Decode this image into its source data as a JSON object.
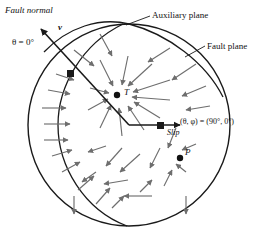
{
  "figure": {
    "type": "focal-mechanism-stereonet",
    "background": "#ffffff",
    "line_color": "#1a1a1a",
    "arrow_color": "#6e6e6e",
    "circle": {
      "cx": 129,
      "cy": 125,
      "r": 101
    },
    "labels": {
      "fault_normal": "Fault normal",
      "theta_zero": "θ = 0°",
      "normal_symbol": "v",
      "auxiliary_plane": "Auxiliary plane",
      "fault_plane": "Fault plane",
      "theta_phi": "(θ, φ) = (90°, 0°)",
      "slip": "Slip",
      "tension_axis": "T",
      "pressure_axis": "P"
    },
    "nodes": {
      "center": {
        "x": 129,
        "y": 125
      },
      "normal_pierce": {
        "x": 71,
        "y": 74
      },
      "slip_pierce": {
        "x": 160,
        "y": 125
      },
      "t_axis": {
        "x": 117,
        "y": 95
      },
      "p_axis": {
        "x": 180,
        "y": 158
      }
    },
    "planes": [
      {
        "name": "auxiliary-plane",
        "path": "M 123 24 C 82 44, 58 86, 58 125 C 58 166, 84 210, 127 226"
      },
      {
        "name": "fault-plane",
        "path": "M 223 97 C 206 63, 168 34, 129 24 C 100 17, 68 27, 44 52"
      }
    ],
    "vectors": {
      "fault_normal_arrow": {
        "x1": 129,
        "y1": 125,
        "x2": 41,
        "y2": 29
      },
      "slip_arrow": {
        "x1": 129,
        "y1": 125,
        "x2": 180,
        "y2": 125
      }
    },
    "leaders": [
      {
        "name": "auxiliary-plane-leader",
        "x1": 150,
        "y1": 16,
        "x2": 126,
        "y2": 25
      },
      {
        "name": "fault-plane-leader",
        "x1": 205,
        "y1": 46,
        "x2": 185,
        "y2": 57
      }
    ],
    "radiation_arrows": [
      {
        "x1": 100,
        "y1": 60,
        "x2": 113,
        "y2": 86,
        "note": "toward-T"
      },
      {
        "x1": 128,
        "y1": 56,
        "x2": 122,
        "y2": 85,
        "note": "toward-T"
      },
      {
        "x1": 152,
        "y1": 64,
        "x2": 128,
        "y2": 86,
        "note": "toward-T"
      },
      {
        "x1": 170,
        "y1": 80,
        "x2": 133,
        "y2": 92,
        "note": "toward-T"
      },
      {
        "x1": 170,
        "y1": 100,
        "x2": 132,
        "y2": 97,
        "note": "toward-T"
      },
      {
        "x1": 160,
        "y1": 118,
        "x2": 134,
        "y2": 102,
        "note": "toward-T"
      },
      {
        "x1": 144,
        "y1": 130,
        "x2": 128,
        "y2": 106,
        "note": "toward-T"
      },
      {
        "x1": 122,
        "y1": 136,
        "x2": 119,
        "y2": 108,
        "note": "toward-T"
      },
      {
        "x1": 100,
        "y1": 128,
        "x2": 111,
        "y2": 105,
        "note": "toward-T"
      },
      {
        "x1": 88,
        "y1": 110,
        "x2": 108,
        "y2": 99,
        "note": "toward-T"
      },
      {
        "x1": 90,
        "y1": 88,
        "x2": 109,
        "y2": 93,
        "note": "toward-T"
      },
      {
        "x1": 170,
        "y1": 48,
        "x2": 148,
        "y2": 62,
        "note": "upper-right-inflow"
      },
      {
        "x1": 196,
        "y1": 64,
        "x2": 172,
        "y2": 80,
        "note": "upper-right-inflow"
      },
      {
        "x1": 206,
        "y1": 86,
        "x2": 182,
        "y2": 96,
        "note": "upper-right-inflow"
      },
      {
        "x1": 210,
        "y1": 106,
        "x2": 186,
        "y2": 110,
        "note": "upper-right-inflow"
      },
      {
        "x1": 100,
        "y1": 34,
        "x2": 112,
        "y2": 56,
        "note": "upper-inflow"
      },
      {
        "x1": 74,
        "y1": 50,
        "x2": 94,
        "y2": 66,
        "note": "upper-inflow"
      },
      {
        "x1": 42,
        "y1": 108,
        "x2": 66,
        "y2": 108,
        "note": "left-outflow"
      },
      {
        "x1": 44,
        "y1": 124,
        "x2": 70,
        "y2": 124,
        "note": "left-outflow"
      },
      {
        "x1": 44,
        "y1": 140,
        "x2": 68,
        "y2": 140,
        "note": "left-outflow"
      },
      {
        "x1": 48,
        "y1": 90,
        "x2": 70,
        "y2": 94,
        "note": "left-outflow"
      },
      {
        "x1": 56,
        "y1": 74,
        "x2": 74,
        "y2": 80,
        "note": "left-outflow"
      },
      {
        "x1": 52,
        "y1": 156,
        "x2": 72,
        "y2": 150,
        "note": "left-outflow"
      },
      {
        "x1": 62,
        "y1": 172,
        "x2": 80,
        "y2": 162,
        "note": "left-outflow"
      },
      {
        "x1": 78,
        "y1": 190,
        "x2": 94,
        "y2": 176,
        "note": "lower-left-outflow"
      },
      {
        "x1": 96,
        "y1": 204,
        "x2": 110,
        "y2": 188,
        "note": "lower-left-outflow"
      },
      {
        "x1": 74,
        "y1": 196,
        "x2": 74,
        "y2": 214,
        "note": "lower-left-down"
      },
      {
        "x1": 122,
        "y1": 148,
        "x2": 106,
        "y2": 166,
        "note": "away-from-center"
      },
      {
        "x1": 106,
        "y1": 146,
        "x2": 88,
        "y2": 152,
        "note": "away-from-center"
      },
      {
        "x1": 140,
        "y1": 154,
        "x2": 120,
        "y2": 172,
        "note": "toward-P"
      },
      {
        "x1": 160,
        "y1": 148,
        "x2": 150,
        "y2": 168,
        "note": "toward-P"
      },
      {
        "x1": 176,
        "y1": 128,
        "x2": 168,
        "y2": 148,
        "note": "toward-P"
      },
      {
        "x1": 196,
        "y1": 144,
        "x2": 182,
        "y2": 150,
        "note": "toward-P"
      },
      {
        "x1": 186,
        "y1": 172,
        "x2": 176,
        "y2": 164,
        "note": "toward-P"
      },
      {
        "x1": 164,
        "y1": 186,
        "x2": 172,
        "y2": 170,
        "note": "toward-P"
      },
      {
        "x1": 140,
        "y1": 192,
        "x2": 152,
        "y2": 180,
        "note": "toward-P"
      },
      {
        "x1": 128,
        "y1": 180,
        "x2": 104,
        "y2": 184,
        "note": "lower-leftward"
      },
      {
        "x1": 152,
        "y1": 196,
        "x2": 124,
        "y2": 196,
        "note": "lower-leftward"
      },
      {
        "x1": 186,
        "y1": 196,
        "x2": 186,
        "y2": 214,
        "note": "lower-down"
      },
      {
        "x1": 96,
        "y1": 172,
        "x2": 82,
        "y2": 182,
        "note": "lower-left-outflow"
      },
      {
        "x1": 112,
        "y1": 208,
        "x2": 124,
        "y2": 196,
        "note": "lower-inflow"
      }
    ]
  }
}
